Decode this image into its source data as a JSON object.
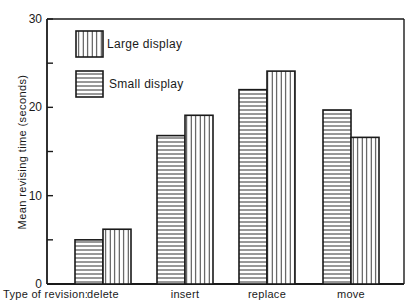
{
  "chart_data": {
    "type": "bar",
    "title": "",
    "xlabel": "Type of revision:",
    "ylabel": "Mean revising time (seconds)",
    "ylim": [
      0,
      30
    ],
    "yticks": [
      0,
      10,
      20,
      30
    ],
    "yminor_ticks": [
      5,
      15,
      25
    ],
    "categories": [
      "delete",
      "insert",
      "replace",
      "move"
    ],
    "series": [
      {
        "name": "Small display",
        "pattern": "horizontal-stripes",
        "values": [
          5.0,
          16.8,
          22.0,
          19.7
        ]
      },
      {
        "name": "Large display",
        "pattern": "vertical-stripes",
        "values": [
          6.2,
          19.1,
          24.1,
          16.6
        ]
      }
    ],
    "legend": {
      "position": "top-left-inside",
      "entries": [
        {
          "label": "Large display",
          "pattern": "vertical-stripes"
        },
        {
          "label": "Small display",
          "pattern": "horizontal-stripes"
        }
      ]
    },
    "grid": false,
    "frame": true
  },
  "colors": {
    "ink": "#1a1a1a",
    "background": "#ffffff"
  }
}
